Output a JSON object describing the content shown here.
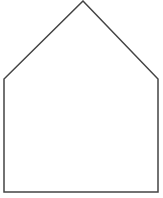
{
  "diagram": {
    "shape": "pentagon",
    "stroke_color": "#444444",
    "fill_color": "#ffffff",
    "stroke_width": 1.5,
    "vertices": [
      {
        "name": "apex",
        "x": 83,
        "y": 1
      },
      {
        "name": "right-shoulder",
        "x": 158,
        "y": 79
      },
      {
        "name": "bottom-right",
        "x": 158,
        "y": 192
      },
      {
        "name": "bottom-left",
        "x": 4,
        "y": 192
      },
      {
        "name": "left-shoulder",
        "x": 4,
        "y": 79
      }
    ]
  }
}
